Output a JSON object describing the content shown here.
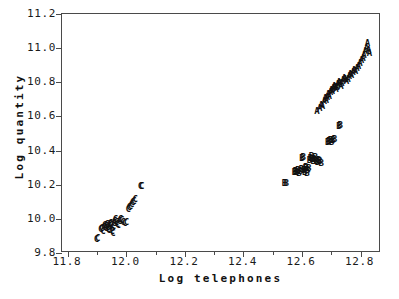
{
  "chart_data": {
    "type": "scatter",
    "title": "",
    "xlabel": "Log telephones",
    "ylabel": "Log quantity",
    "xlim": [
      11.78,
      12.87
    ],
    "ylim": [
      9.8,
      11.2
    ],
    "grid": false,
    "legend_position": "none",
    "x_ticks": [
      11.8,
      12.0,
      12.2,
      12.4,
      12.6,
      12.8
    ],
    "x_tick_labels": [
      "11.8",
      "12.0",
      "12.2",
      "12.4",
      "12.6",
      "12.8"
    ],
    "x_minor_ticks": [
      11.9,
      12.1,
      12.3,
      12.5,
      12.7
    ],
    "y_ticks": [
      9.8,
      10.0,
      10.2,
      10.4,
      10.6,
      10.8,
      11.0,
      11.2
    ],
    "y_tick_labels": [
      "9.8",
      "10.0",
      "10.2",
      "10.4",
      "10.6",
      "10.8",
      "11.0",
      "11.2"
    ],
    "series": [
      {
        "name": "A",
        "marker": "A",
        "points": [
          [
            12.651,
            10.632
          ],
          [
            12.661,
            10.651
          ],
          [
            12.666,
            10.668
          ],
          [
            12.67,
            10.662
          ],
          [
            12.676,
            10.688
          ],
          [
            12.679,
            10.706
          ],
          [
            12.683,
            10.698
          ],
          [
            12.686,
            10.714
          ],
          [
            12.69,
            10.731
          ],
          [
            12.693,
            10.722
          ],
          [
            12.697,
            10.742
          ],
          [
            12.7,
            10.757
          ],
          [
            12.703,
            10.748
          ],
          [
            12.707,
            10.766
          ],
          [
            12.71,
            10.779
          ],
          [
            12.713,
            10.77
          ],
          [
            12.716,
            10.758
          ],
          [
            12.719,
            10.773
          ],
          [
            12.722,
            10.789
          ],
          [
            12.726,
            10.801
          ],
          [
            12.729,
            10.793
          ],
          [
            12.733,
            10.778
          ],
          [
            12.736,
            10.795
          ],
          [
            12.74,
            10.812
          ],
          [
            12.744,
            10.826
          ],
          [
            12.748,
            10.818
          ],
          [
            12.752,
            10.806
          ],
          [
            12.757,
            10.822
          ],
          [
            12.761,
            10.838
          ],
          [
            12.765,
            10.851
          ],
          [
            12.769,
            10.843
          ],
          [
            12.774,
            10.858
          ],
          [
            12.778,
            10.872
          ],
          [
            12.783,
            10.866
          ],
          [
            12.788,
            10.881
          ],
          [
            12.793,
            10.895
          ],
          [
            12.798,
            10.912
          ],
          [
            12.803,
            10.928
          ],
          [
            12.808,
            10.944
          ],
          [
            12.812,
            10.962
          ],
          [
            12.816,
            10.981
          ],
          [
            12.82,
            11.002
          ],
          [
            12.824,
            11.028
          ],
          [
            12.828,
            10.99
          ],
          [
            12.831,
            10.971
          ]
        ]
      },
      {
        "name": "B",
        "marker": "B",
        "points": [
          [
            12.54,
            10.208
          ],
          [
            12.546,
            10.212
          ],
          [
            12.574,
            10.276
          ],
          [
            12.578,
            10.282
          ],
          [
            12.582,
            10.272
          ],
          [
            12.586,
            10.288
          ],
          [
            12.59,
            10.266
          ],
          [
            12.594,
            10.279
          ],
          [
            12.598,
            10.291
          ],
          [
            12.6,
            10.355
          ],
          [
            12.604,
            10.362
          ],
          [
            12.606,
            10.284
          ],
          [
            12.609,
            10.272
          ],
          [
            12.612,
            10.296
          ],
          [
            12.614,
            10.306
          ],
          [
            12.617,
            10.268
          ],
          [
            12.62,
            10.286
          ],
          [
            12.623,
            10.3
          ],
          [
            12.626,
            10.345
          ],
          [
            12.629,
            10.358
          ],
          [
            12.632,
            10.368
          ],
          [
            12.635,
            10.352
          ],
          [
            12.638,
            10.338
          ],
          [
            12.641,
            10.348
          ],
          [
            12.645,
            10.362
          ],
          [
            12.649,
            10.341
          ],
          [
            12.653,
            10.332
          ],
          [
            12.657,
            10.344
          ],
          [
            12.661,
            10.336
          ],
          [
            12.666,
            10.33
          ],
          [
            12.688,
            10.448
          ],
          [
            12.692,
            10.455
          ],
          [
            12.697,
            10.462
          ],
          [
            12.701,
            10.452
          ],
          [
            12.706,
            10.46
          ],
          [
            12.711,
            10.466
          ],
          [
            12.726,
            10.545
          ],
          [
            12.731,
            10.549
          ]
        ]
      },
      {
        "name": "C",
        "marker": "C",
        "points": [
          [
            11.898,
            9.884
          ],
          [
            11.902,
            9.89
          ],
          [
            11.912,
            9.938
          ],
          [
            11.916,
            9.946
          ],
          [
            11.92,
            9.93
          ],
          [
            11.923,
            9.952
          ],
          [
            11.926,
            9.962
          ],
          [
            11.929,
            9.944
          ],
          [
            11.931,
            9.958
          ],
          [
            11.934,
            9.968
          ],
          [
            11.936,
            9.95
          ],
          [
            11.938,
            9.942
          ],
          [
            11.94,
            9.936
          ],
          [
            11.942,
            9.956
          ],
          [
            11.944,
            9.97
          ],
          [
            11.946,
            9.978
          ],
          [
            11.948,
            9.962
          ],
          [
            11.95,
            9.946
          ],
          [
            11.952,
            9.928
          ],
          [
            11.954,
            9.918
          ],
          [
            11.956,
            9.96
          ],
          [
            11.958,
            9.976
          ],
          [
            11.96,
            9.99
          ],
          [
            11.963,
            10.0
          ],
          [
            11.966,
            9.984
          ],
          [
            11.969,
            9.972
          ],
          [
            11.972,
            9.962
          ],
          [
            11.976,
            9.988
          ],
          [
            11.98,
            10.002
          ],
          [
            11.984,
            9.996
          ],
          [
            11.988,
            9.982
          ],
          [
            11.994,
            9.976
          ],
          [
            12.0,
            9.984
          ],
          [
            12.006,
            10.058
          ],
          [
            12.01,
            10.068
          ],
          [
            12.014,
            10.078
          ],
          [
            12.018,
            10.086
          ],
          [
            12.022,
            10.098
          ],
          [
            12.026,
            10.106
          ],
          [
            12.03,
            10.114
          ],
          [
            12.048,
            10.19
          ],
          [
            12.052,
            10.194
          ]
        ]
      }
    ]
  }
}
